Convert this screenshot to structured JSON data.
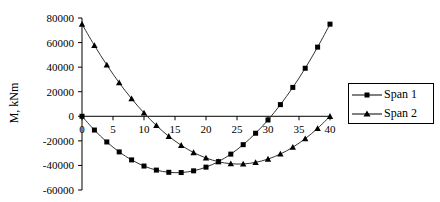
{
  "chart_data": {
    "type": "line",
    "title": "",
    "xlabel": "",
    "ylabel": "M, kNm",
    "xlim": [
      0,
      40
    ],
    "ylim": [
      -60000,
      80000
    ],
    "x_ticks": [
      0,
      5,
      10,
      15,
      20,
      25,
      30,
      35,
      40
    ],
    "x_tick_labels": [
      "0",
      "5",
      "10",
      "15",
      "20",
      "25",
      "30",
      "35",
      "40"
    ],
    "y_ticks": [
      80000,
      60000,
      40000,
      20000,
      0,
      -20000,
      -40000,
      -60000
    ],
    "y_tick_labels": [
      "80000",
      "60000",
      "40000",
      "20000",
      "0",
      "-20000",
      "-40000",
      "-60000"
    ],
    "grid": false,
    "legend_position": "right",
    "x": [
      0,
      2,
      4,
      6,
      8,
      10,
      12,
      14,
      16,
      18,
      20,
      22,
      24,
      26,
      28,
      30,
      32,
      34,
      36,
      38,
      40
    ],
    "series": [
      {
        "name": "Span 1",
        "marker": "square",
        "values": [
          0,
          -11200,
          -20900,
          -29000,
          -35500,
          -40500,
          -43800,
          -45600,
          -45800,
          -44400,
          -41400,
          -36900,
          -30800,
          -23100,
          -13800,
          -3000,
          9500,
          23500,
          39100,
          56300,
          75000
        ]
      },
      {
        "name": "Span 2",
        "marker": "triangle",
        "values": [
          75000,
          57700,
          41800,
          27300,
          14300,
          2700,
          -7500,
          -16300,
          -23600,
          -29500,
          -33900,
          -37000,
          -38600,
          -38800,
          -37500,
          -34800,
          -30700,
          -25200,
          -18200,
          -9800,
          0
        ]
      }
    ]
  },
  "legend": {
    "items": [
      {
        "label": "Span 1",
        "marker": "square"
      },
      {
        "label": "Span 2",
        "marker": "triangle"
      }
    ]
  },
  "colors": {
    "line": "#000000",
    "background": "#ffffff"
  }
}
